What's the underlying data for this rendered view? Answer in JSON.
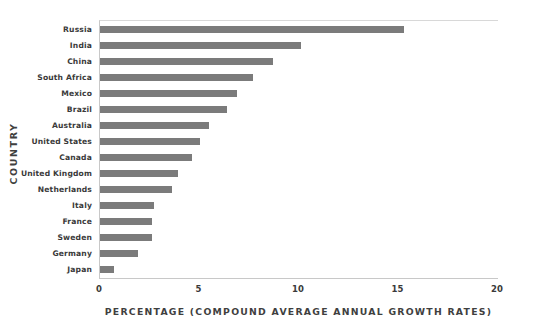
{
  "chart_data": {
    "type": "bar",
    "orientation": "horizontal",
    "title": "",
    "xlabel": "PERCENTAGE (COMPOUND AVERAGE ANNUAL GROWTH RATES)",
    "ylabel": "COUNTRY",
    "xlim": [
      0,
      20
    ],
    "xticks": [
      "0",
      "5",
      "10",
      "15",
      "20"
    ],
    "grid": false,
    "legend": null,
    "bar_color": "#7b7b7b",
    "categories": [
      "Russia",
      "India",
      "China",
      "South Africa",
      "Mexico",
      "Brazil",
      "Australia",
      "United States",
      "Canada",
      "United Kingdom",
      "Netherlands",
      "Italy",
      "France",
      "Sweden",
      "Germany",
      "Japan"
    ],
    "values": [
      15.3,
      10.1,
      8.7,
      7.7,
      6.9,
      6.4,
      5.5,
      5.0,
      4.6,
      3.9,
      3.6,
      2.7,
      2.6,
      2.6,
      1.9,
      0.7
    ]
  }
}
